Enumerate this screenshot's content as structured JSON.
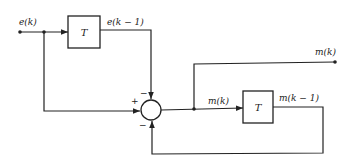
{
  "diagram": {
    "type": "block-diagram",
    "colors": {
      "stroke": "#222222",
      "background": "#ffffff"
    },
    "signals": {
      "input": "e(k)",
      "delayed_input": "e(k − 1)",
      "output": "m(k)",
      "feedback_signal": "m(k)",
      "delayed_output": "m(k − 1)"
    },
    "blocks": [
      {
        "id": "delay-top",
        "label": "T"
      },
      {
        "id": "delay-bottom",
        "label": "T"
      }
    ],
    "summing_junction": {
      "signs": {
        "left": "+",
        "top": "−",
        "bottom": "−"
      }
    }
  }
}
